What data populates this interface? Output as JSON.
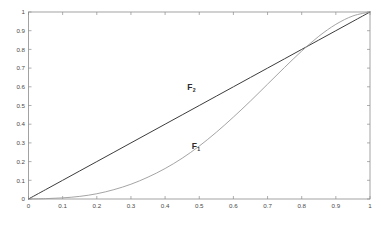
{
  "chart_data": {
    "type": "line",
    "title": "",
    "subtitle": "",
    "xlabel": "",
    "ylabel": "",
    "xlim": [
      0,
      1
    ],
    "ylim": [
      0,
      1
    ],
    "grid": false,
    "legend_position": "inline-annotation",
    "box": true,
    "x_ticks": [
      0,
      0.1,
      0.2,
      0.3,
      0.4,
      0.5,
      0.6,
      0.7,
      0.8,
      0.9,
      1
    ],
    "x_tick_labels": [
      "0",
      "0.1",
      "0.2",
      "0.3",
      "0.4",
      "0.5",
      "0.6",
      "0.7",
      "0.8",
      "0.9",
      "1"
    ],
    "y_ticks": [
      0,
      0.1,
      0.2,
      0.3,
      0.4,
      0.5,
      0.6,
      0.7,
      0.8,
      0.9,
      1
    ],
    "y_tick_labels": [
      "0",
      "0.1",
      "0.2",
      "0.3",
      "0.4",
      "0.5",
      "0.6",
      "0.7",
      "0.8",
      "0.9",
      "1"
    ],
    "series": [
      {
        "name": "F2",
        "label_text": "F",
        "label_subscript": "2",
        "color": "#3c3c3c",
        "linewidth": 1.0,
        "label_x": 0.465,
        "label_y": 0.585,
        "description": "straight diagonal identity line from (0,0) to (1,1)",
        "x": [
          0,
          0.05,
          0.1,
          0.15,
          0.2,
          0.25,
          0.3,
          0.35,
          0.4,
          0.45,
          0.5,
          0.55,
          0.6,
          0.65,
          0.7,
          0.75,
          0.8,
          0.85,
          0.9,
          0.95,
          1
        ],
        "y": [
          0,
          0.05,
          0.1,
          0.15,
          0.2,
          0.25,
          0.3,
          0.35,
          0.4,
          0.45,
          0.5,
          0.55,
          0.6,
          0.65,
          0.7,
          0.75,
          0.8,
          0.85,
          0.9,
          0.95,
          1
        ]
      },
      {
        "name": "F1",
        "label_text": "F",
        "label_subscript": "1",
        "color": "#9a9a9a",
        "linewidth": 0.9,
        "label_x": 0.478,
        "label_y": 0.268,
        "description": "convex then sigmoid curve, near zero until x=0.15, crosses the diagonal near x=0.77, reaches (1,1)",
        "x": [
          0,
          0.05,
          0.1,
          0.15,
          0.2,
          0.25,
          0.3,
          0.35,
          0.4,
          0.45,
          0.5,
          0.55,
          0.6,
          0.65,
          0.7,
          0.75,
          0.8,
          0.85,
          0.9,
          0.95,
          1
        ],
        "y": [
          0.0,
          0.002,
          0.006,
          0.014,
          0.028,
          0.05,
          0.079,
          0.117,
          0.163,
          0.218,
          0.283,
          0.357,
          0.438,
          0.524,
          0.614,
          0.704,
          0.791,
          0.87,
          0.934,
          0.979,
          1.0
        ]
      }
    ],
    "crossing_point": [
      0.77,
      0.745
    ]
  },
  "annotations": {
    "label_f2": "F",
    "label_f2_sub": "2",
    "label_f1": "F",
    "label_f1_sub": "1"
  },
  "colors": {
    "background": "#ffffff",
    "axis": "#8c8c8c",
    "tick_text": "#4a4a4a",
    "series_f2": "#3c3c3c",
    "series_f1": "#9a9a9a"
  }
}
